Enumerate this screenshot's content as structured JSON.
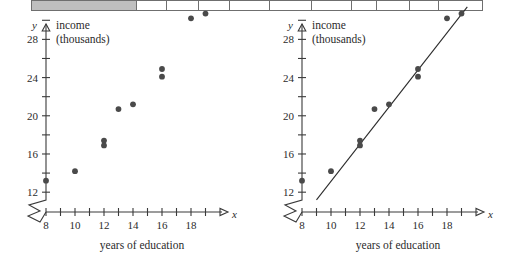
{
  "figure": {
    "panels": [
      {
        "id": "left",
        "name": "scatterplot-without-line",
        "y_axis_var": "y",
        "x_axis_var": "x",
        "y_axis_title_line1": "income",
        "y_axis_title_line2": "(thousands)",
        "x_axis_title": "years of education",
        "has_regression_line": false
      },
      {
        "id": "right",
        "name": "scatterplot-with-regression-line",
        "y_axis_var": "y",
        "x_axis_var": "x",
        "y_axis_title_line1": "income",
        "y_axis_title_line2": "(thousands)",
        "x_axis_title": "years of education",
        "has_regression_line": true
      }
    ],
    "top_table_strip": {
      "name": "cut-off-table-row",
      "cells": [
        {
          "width": 106,
          "shaded": true
        },
        {
          "width": 30,
          "shaded": false
        },
        {
          "width": 32,
          "shaded": false
        },
        {
          "width": 31,
          "shaded": false
        },
        {
          "width": 40,
          "shaded": false
        },
        {
          "width": 42,
          "shaded": false
        },
        {
          "width": 40,
          "shaded": false
        },
        {
          "width": 25,
          "shaded": false
        },
        {
          "width": 33,
          "shaded": false
        },
        {
          "width": 29,
          "shaded": false
        },
        {
          "width": 44,
          "shaded": false
        }
      ],
      "left_offset": 31
    }
  },
  "chart_data": {
    "type": "scatter",
    "title": "",
    "xlabel": "years of education",
    "ylabel": "income (thousands)",
    "xlim": [
      7.4,
      19.6
    ],
    "ylim": [
      10.6,
      32.0
    ],
    "x_ticks": [
      8,
      9,
      10,
      11,
      12,
      13,
      14,
      15,
      16,
      17,
      18,
      19
    ],
    "x_tick_labels": [
      "8",
      "",
      "10",
      "",
      "12",
      "",
      "14",
      "",
      "16",
      "",
      "18",
      ""
    ],
    "y_ticks": [
      12,
      14,
      16,
      18,
      20,
      22,
      24,
      26,
      28,
      30
    ],
    "y_tick_labels": [
      "12",
      "",
      "16",
      "",
      "20",
      "",
      "24",
      "",
      "28",
      ""
    ],
    "grid": false,
    "legend": null,
    "axis_break_x": true,
    "axis_break_y": true,
    "x": [
      8,
      10,
      12,
      12,
      13,
      14,
      16,
      16,
      18,
      19
    ],
    "y": [
      13.2,
      14.2,
      17.4,
      16.9,
      20.7,
      21.2,
      24.9,
      24.1,
      30.2,
      30.7
    ],
    "points": [
      {
        "x": 8,
        "y": 13.2
      },
      {
        "x": 10,
        "y": 14.2
      },
      {
        "x": 12,
        "y": 17.4
      },
      {
        "x": 12,
        "y": 16.9
      },
      {
        "x": 13,
        "y": 20.7
      },
      {
        "x": 14,
        "y": 21.2
      },
      {
        "x": 16,
        "y": 24.9
      },
      {
        "x": 16,
        "y": 24.1
      },
      {
        "x": 18,
        "y": 30.2
      },
      {
        "x": 19,
        "y": 30.7
      }
    ],
    "regression_line": {
      "panel": "right",
      "x_start": 9.0,
      "y_start": 11.2,
      "x_end": 19.4,
      "y_end": 31.4
    }
  }
}
